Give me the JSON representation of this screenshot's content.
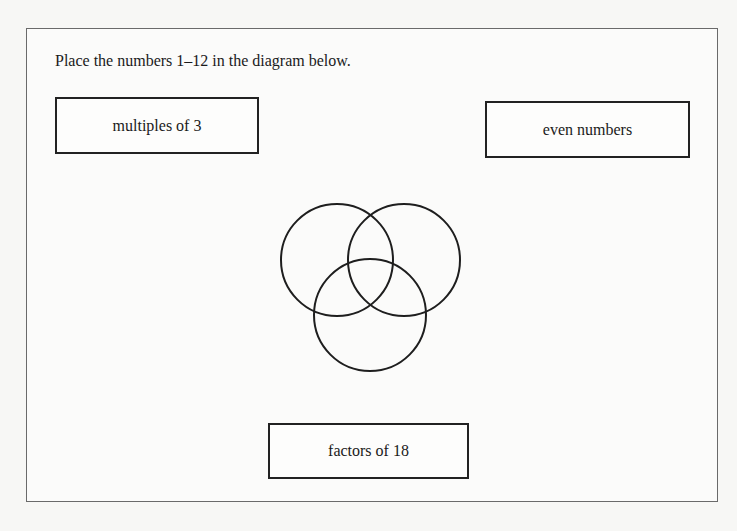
{
  "instruction": "Place the numbers 1–12 in the diagram below.",
  "labels": {
    "multiples_of_3": "multiples of 3",
    "even_numbers": "even numbers",
    "factors_of_18": "factors of 18"
  },
  "venn": {
    "circles": [
      {
        "name": "left-circle",
        "cx": 337,
        "cy": 260,
        "r": 56
      },
      {
        "name": "right-circle",
        "cx": 404,
        "cy": 260,
        "r": 56
      },
      {
        "name": "bottom-circle",
        "cx": 370,
        "cy": 315,
        "r": 56
      }
    ],
    "stroke": "#1e1e1e"
  }
}
